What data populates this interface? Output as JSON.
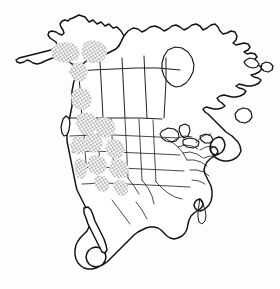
{
  "figure": {
    "description": "Outline map of North America showing political boundaries of Canadian provinces, United States states, Mexico and Central America, with stippled shading marking a species distribution range.",
    "width": 280,
    "height": 289,
    "background_color": "#ffffff",
    "line_color": "#111111",
    "stipple_color": "#1a1a1a",
    "shading_style": "stipple"
  },
  "legend": {
    "shaded_meaning": "distribution range",
    "unshaded_meaning": "outside range"
  },
  "map_data": {
    "type": "choropleth-range-map",
    "projection": "conic",
    "regions_shaded": [
      "Alaska interior",
      "Yukon",
      "British Columbia",
      "Alberta (west)",
      "Washington",
      "Oregon",
      "Idaho",
      "Montana (west)",
      "Wyoming",
      "Nevada",
      "Utah",
      "Colorado",
      "California (Sierra Nevada)",
      "Arizona (north)",
      "New Mexico (north)"
    ],
    "regions_unshaded": [
      "Northwest Territories",
      "Nunavut",
      "Saskatchewan",
      "Manitoba",
      "Ontario",
      "Quebec",
      "Labrador",
      "Newfoundland",
      "Maritime provinces",
      "Great Plains",
      "Midwest",
      "Southeast United States",
      "Texas",
      "Florida",
      "Mexico",
      "Baja California",
      "Central America"
    ]
  },
  "features": {
    "water_bodies": [
      "Hudson Bay",
      "Great Lakes",
      "Gulf of Mexico",
      "Gulf of California"
    ],
    "islands": [
      "Vancouver Island",
      "Newfoundland"
    ]
  }
}
